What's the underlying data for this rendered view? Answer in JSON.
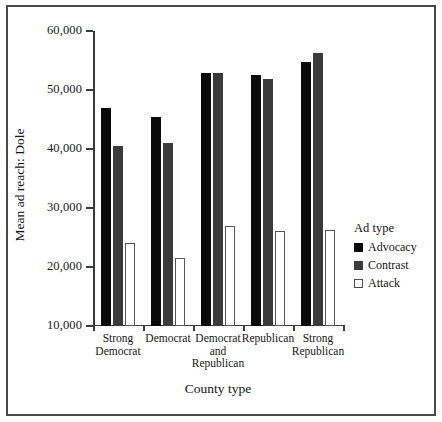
{
  "chart_data": {
    "type": "bar",
    "title": "",
    "xlabel": "County type",
    "ylabel": "Mean ad reach: Dole",
    "categories": [
      "Strong\nDemocrat",
      "Democrat",
      "Democrat\nand\nRepublican",
      "Republican",
      "Strong\nRepublican"
    ],
    "category_lines": [
      [
        "Strong",
        "Democrat"
      ],
      [
        "Democrat"
      ],
      [
        "Democrat",
        "and",
        "Republican"
      ],
      [
        "Republican"
      ],
      [
        "Strong",
        "Republican"
      ]
    ],
    "series": [
      {
        "name": "Advocacy",
        "color": "#0a0a0a",
        "values": [
          47000,
          45500,
          52800,
          52600,
          54800
        ]
      },
      {
        "name": "Contrast",
        "color": "#3b3b3b",
        "values": [
          40500,
          41000,
          52800,
          51800,
          56200
        ]
      },
      {
        "name": "Attack",
        "color": "#ffffff",
        "values": [
          24000,
          21600,
          27000,
          26100,
          26200
        ]
      }
    ],
    "ylim": [
      10000,
      60000
    ],
    "ytick_values": [
      10000,
      20000,
      30000,
      40000,
      50000,
      60000
    ],
    "ytick_labels": [
      "10,000",
      "20,000",
      "30,000",
      "40,000",
      "50,000",
      "60,000"
    ],
    "grid": false,
    "legend_position": "right"
  },
  "legend": {
    "title": "Ad type",
    "entries": [
      {
        "label": "Advocacy",
        "swatch": "advocacy"
      },
      {
        "label": "Contrast",
        "swatch": "contrast"
      },
      {
        "label": "Attack",
        "swatch": "attack"
      }
    ]
  }
}
